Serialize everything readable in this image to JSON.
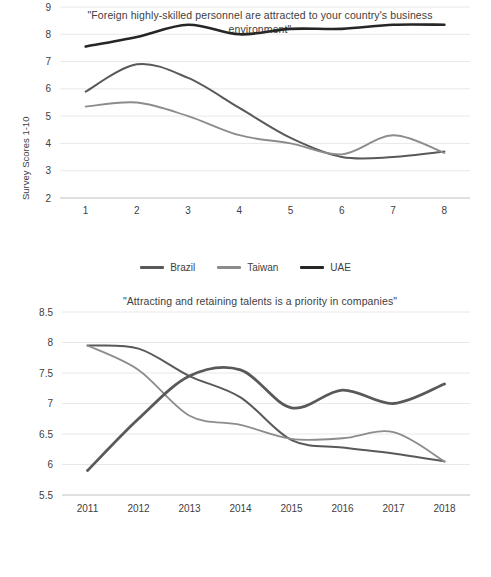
{
  "charts": [
    {
      "id": "chart-1",
      "title": "\"Foreign highly-skilled personnel are attracted to your country's business environment\"",
      "ylabel": "Survey Scores 1-10",
      "chart_data": {
        "type": "line",
        "title": "\"Foreign highly-skilled personnel are attracted to your country's business environment\"",
        "xlabel": "",
        "ylabel": "Survey Scores 1-10",
        "x": [
          "1",
          "2",
          "3",
          "4",
          "5",
          "6",
          "7",
          "8"
        ],
        "xticklabels": [
          "1",
          "2",
          "3",
          "4",
          "5",
          "6",
          "7",
          "8"
        ],
        "yticklabels": [
          "2",
          "3",
          "4",
          "5",
          "6",
          "7",
          "8",
          "9"
        ],
        "ylim": [
          2,
          9
        ],
        "ytick_step": 1,
        "grid": "horizontal",
        "legend_position": "bottom",
        "smoothed": true,
        "series": [
          {
            "name": "Brazil",
            "color": "#595959",
            "width": 2.0,
            "values": [
              5.9,
              6.9,
              6.4,
              5.3,
              4.2,
              3.5,
              3.5,
              3.7
            ]
          },
          {
            "name": "Taiwan",
            "color": "#8c8c8c",
            "width": 1.8,
            "values": [
              5.35,
              5.5,
              5.0,
              4.3,
              4.0,
              3.6,
              4.3,
              3.65
            ]
          },
          {
            "name": "UAE",
            "color": "#262626",
            "width": 2.6,
            "values": [
              7.55,
              7.9,
              8.35,
              8.0,
              8.2,
              8.2,
              8.35,
              8.35
            ]
          }
        ]
      }
    },
    {
      "id": "chart-2",
      "title": "\"Attracting and retaining talents is a priority in companies\"",
      "ylabel": "Survey Scores 1-10",
      "chart_data": {
        "type": "line",
        "title": "\"Attracting and retaining talents is a priority in companies\"",
        "xlabel": "",
        "ylabel": "Survey Scores 1-10",
        "x": [
          "2011",
          "2012",
          "2013",
          "2014",
          "2015",
          "2016",
          "2017",
          "2018"
        ],
        "xticklabels": [
          "2011",
          "2012",
          "2013",
          "2014",
          "2015",
          "2016",
          "2017",
          "2018"
        ],
        "yticklabels": [
          "5.5",
          "6",
          "6.5",
          "7",
          "7.5",
          "8",
          "8.5"
        ],
        "ylim": [
          5.5,
          8.5
        ],
        "ytick_step": 0.5,
        "grid": "horizontal",
        "legend_position": "bottom",
        "smoothed": true,
        "series": [
          {
            "name": "Brazil",
            "color": "#595959",
            "width": 2.0,
            "values": [
              7.95,
              7.9,
              7.45,
              7.1,
              6.4,
              6.28,
              6.18,
              6.05
            ]
          },
          {
            "name": "Taiwan",
            "color": "#8c8c8c",
            "width": 1.8,
            "values": [
              7.95,
              7.55,
              6.8,
              6.65,
              6.42,
              6.43,
              6.53,
              6.05
            ]
          },
          {
            "name": "UAE",
            "color": "#595959",
            "width": 2.8,
            "values": [
              5.9,
              6.75,
              7.45,
              7.55,
              6.93,
              7.22,
              7.0,
              7.32
            ]
          }
        ]
      }
    }
  ],
  "colors": {
    "brazil": "#595959",
    "taiwan": "#8c8c8c",
    "uae": "#262626",
    "gridline": "#e2e2e2",
    "text": "#404040",
    "background": "#ffffff"
  }
}
